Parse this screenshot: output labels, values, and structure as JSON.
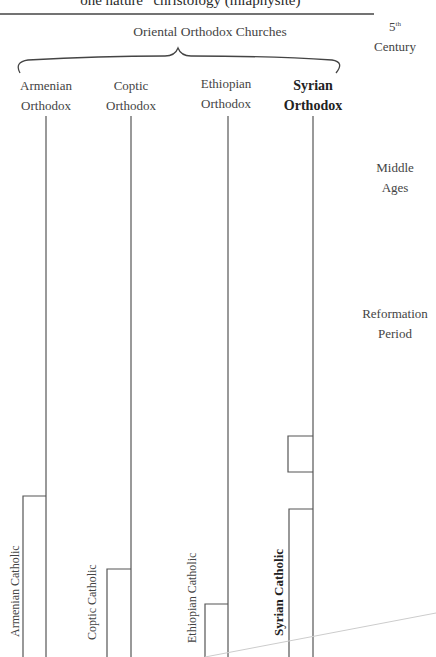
{
  "header": {
    "caption": "“one nature” christology (miaphysite)"
  },
  "periods": [
    {
      "sup_label": "5",
      "sup": "th",
      "label": "Century"
    },
    {
      "label_line1": "Middle",
      "label_line2": "Ages"
    },
    {
      "label_line1": "Reformation",
      "label_line2": "Period"
    }
  ],
  "family": {
    "title": "Oriental Orthodox Churches"
  },
  "churches": [
    {
      "line1": "Armenian",
      "line2": "Orthodox",
      "catholic_branch": "Armenian Catholic",
      "emphasis": false
    },
    {
      "line1": "Coptic",
      "line2": "Orthodox",
      "catholic_branch": "Coptic Catholic",
      "emphasis": false
    },
    {
      "line1": "Ethiopian",
      "line2": "Orthodox",
      "catholic_branch": "Ethiopian Catholic",
      "emphasis": false
    },
    {
      "line1": "Syrian",
      "line2": "Orthodox",
      "catholic_branch": "Syrian Catholic",
      "emphasis": true
    }
  ],
  "colors": {
    "line": "#555555",
    "faint_line": "#cccccc",
    "text": "#444444"
  }
}
